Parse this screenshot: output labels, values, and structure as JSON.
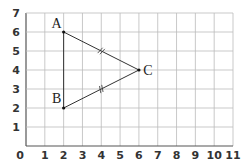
{
  "figure": {
    "type": "coordinate-grid-diagram",
    "x_ticks": [
      "0",
      "1",
      "2",
      "3",
      "4",
      "5",
      "6",
      "7",
      "8",
      "9",
      "10",
      "11"
    ],
    "y_ticks": [
      "1",
      "2",
      "3",
      "4",
      "5",
      "6",
      "7"
    ],
    "xlim": [
      0,
      11
    ],
    "ylim": [
      0,
      7
    ],
    "colors": {
      "grid": "#bbbbbb",
      "axis": "#555555",
      "line": "#333333"
    },
    "points": [
      {
        "label": "A",
        "x": 2,
        "y": 6
      },
      {
        "label": "B",
        "x": 2,
        "y": 2
      },
      {
        "label": "C",
        "x": 6,
        "y": 4
      }
    ],
    "segments": [
      {
        "from": "A",
        "to": "B",
        "tick_marks": 0
      },
      {
        "from": "A",
        "to": "C",
        "tick_marks": 2
      },
      {
        "from": "B",
        "to": "C",
        "tick_marks": 2
      }
    ]
  }
}
